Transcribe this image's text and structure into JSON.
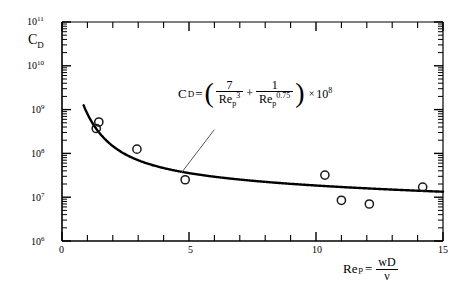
{
  "chart_data": {
    "type": "scatter",
    "title": "",
    "xlabel": "Re_p = wD/v",
    "ylabel": "C_D",
    "xlim": [
      0,
      15
    ],
    "ylim": [
      1000000.0,
      100000000000.0
    ],
    "yscale": "log",
    "xscale": "linear",
    "grid": false,
    "legend": null,
    "x_ticks": [
      0,
      1,
      2,
      3,
      4,
      5,
      6,
      7,
      8,
      9,
      10,
      11,
      12,
      13,
      14,
      15
    ],
    "x_tick_labels": [
      "0",
      "",
      "",
      "",
      "",
      "5",
      "",
      "",
      "",
      "",
      "10",
      "",
      "",
      "",
      "",
      "15"
    ],
    "y_ticks": [
      1000000,
      10000000,
      100000000,
      1000000000,
      10000000000,
      100000000000
    ],
    "y_tick_labels": [
      "10⁶",
      "10⁷",
      "10⁸",
      "10⁹",
      "10¹⁰",
      "10¹¹"
    ],
    "series": [
      {
        "name": "measured data",
        "type": "scatter",
        "marker": "open-circle",
        "x": [
          1.45,
          1.35,
          2.95,
          4.85,
          10.35,
          11.0,
          12.1,
          14.2
        ],
        "y": [
          520000000.0,
          370000000.0,
          125000000.0,
          25000000.0,
          32000000.0,
          8500000.0,
          7000000.0,
          17000000.0
        ]
      },
      {
        "name": "correlation curve",
        "type": "line",
        "equation": "C_D = (7/Re_p^3 + 1/Re_p^0.75) x 10^8",
        "x_start": 0.85,
        "x_end": 15.0
      }
    ],
    "annotations": [
      {
        "name": "equation-label",
        "text": "C_D = ( 7/Re_p^3 + 1/Re_p^0.75 ) x 10^8",
        "leader_from": [
          6.0,
          350000000.0
        ],
        "leader_to": [
          4.7,
          36000000.0
        ]
      }
    ]
  },
  "labels": {
    "y_axis_title": "C",
    "y_axis_title_sub": "D",
    "x_axis_title_base": "Re",
    "x_axis_title_sub": "p",
    "x_axis_equals": "=",
    "x_axis_num": "wD",
    "x_axis_den": "ν",
    "x_tick_0": "0",
    "x_tick_5": "5",
    "x_tick_10": "10",
    "x_tick_15": "15",
    "y_tick_6": "10",
    "y_tick_6_exp": "6",
    "y_tick_7": "10",
    "y_tick_7_exp": "7",
    "y_tick_8": "10",
    "y_tick_8_exp": "8",
    "y_tick_9": "10",
    "y_tick_9_exp": "9",
    "y_tick_10": "10",
    "y_tick_10_exp": "10",
    "y_tick_11": "10",
    "y_tick_11_exp": "11"
  },
  "equation": {
    "cd": "C",
    "cd_sub": "D",
    "equals": "=",
    "paren_open": "(",
    "paren_close": ")",
    "num1": "7",
    "den1_base": "Re",
    "den1_sub": "p",
    "den1_sup": "3",
    "plus": "+",
    "num2": "1",
    "den2_base": "Re",
    "den2_sub": "p",
    "den2_sup": "0.75",
    "times": "×",
    "ten": "10",
    "ten_exp": "8"
  },
  "colors": {
    "axis": "#000000",
    "curve": "#000000",
    "marker_stroke": "#1a1a1a",
    "background": "#ffffff",
    "leader": "#555555"
  }
}
